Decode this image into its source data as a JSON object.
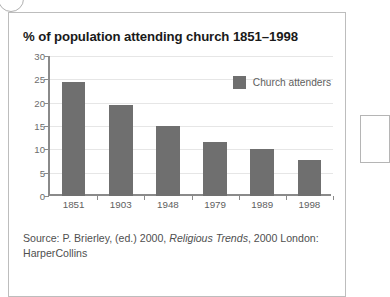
{
  "figure": {
    "title": "% of population attending church 1851–1998",
    "source": {
      "prefix": "Source: P. Brierley, (ed.) 2000, ",
      "italic_title": "Religious Trends",
      "suffix": ", 2000 London: HarperCollins"
    }
  },
  "colors": {
    "bar": "#6f6f6f",
    "axis": "#8a8a8a",
    "grid": "#e6e6e6",
    "panel_border": "#bdbdbd",
    "title_text": "#1a1a1a",
    "tick_text": "#5e5e5e"
  },
  "chart_data": {
    "type": "bar",
    "title": "% of population attending church 1851–1998",
    "xlabel": "",
    "ylabel": "",
    "categories": [
      "1851",
      "1903",
      "1948",
      "1979",
      "1989",
      "1998"
    ],
    "values": [
      24.5,
      19.5,
      15.0,
      11.5,
      10.1,
      7.7
    ],
    "series": [
      {
        "name": "Church attenders",
        "values": [
          24.5,
          19.5,
          15.0,
          11.5,
          10.1,
          7.7
        ]
      }
    ],
    "ylim": [
      0,
      30
    ],
    "yticks": [
      0,
      5,
      10,
      15,
      20,
      25,
      30
    ],
    "ytick_labels": [
      "0",
      "5",
      "10",
      "15",
      "20",
      "25",
      "30"
    ],
    "grid": true,
    "legend": {
      "position": "top-right",
      "entries": [
        "Church attenders"
      ]
    }
  }
}
